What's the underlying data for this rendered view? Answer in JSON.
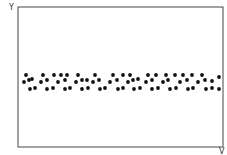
{
  "chart_data": {
    "type": "scatter",
    "title": "",
    "xlabel": "V",
    "ylabel": "Y",
    "grid": false,
    "legend": null,
    "xlim": [
      18,
      223
    ],
    "ylim": [
      147,
      7
    ],
    "note": "Dots form a horizontal band near the vertical middle of the plot, showing no relation between V and Y (pixel coordinates).",
    "points": [
      [
        26,
        75
      ],
      [
        43,
        75
      ],
      [
        54,
        75
      ],
      [
        61,
        75
      ],
      [
        67,
        75
      ],
      [
        78,
        75
      ],
      [
        95,
        75
      ],
      [
        113,
        75
      ],
      [
        123,
        75
      ],
      [
        130,
        75
      ],
      [
        148,
        75
      ],
      [
        156,
        75
      ],
      [
        166,
        75
      ],
      [
        175,
        75
      ],
      [
        183,
        75
      ],
      [
        192,
        75
      ],
      [
        202,
        75
      ],
      [
        219,
        77
      ],
      [
        24,
        82
      ],
      [
        29,
        80
      ],
      [
        32,
        79
      ],
      [
        41,
        82
      ],
      [
        47,
        80
      ],
      [
        58,
        82
      ],
      [
        65,
        80
      ],
      [
        76,
        82
      ],
      [
        82,
        80
      ],
      [
        87,
        80
      ],
      [
        93,
        82
      ],
      [
        99,
        80
      ],
      [
        110,
        82
      ],
      [
        117,
        80
      ],
      [
        128,
        82
      ],
      [
        133,
        80
      ],
      [
        138,
        79
      ],
      [
        146,
        82
      ],
      [
        152,
        80
      ],
      [
        163,
        82
      ],
      [
        168,
        80
      ],
      [
        180,
        82
      ],
      [
        187,
        80
      ],
      [
        198,
        82
      ],
      [
        205,
        80
      ],
      [
        212,
        81
      ],
      [
        30,
        89
      ],
      [
        35,
        88
      ],
      [
        47,
        89
      ],
      [
        53,
        88
      ],
      [
        65,
        89
      ],
      [
        70,
        88
      ],
      [
        82,
        89
      ],
      [
        88,
        88
      ],
      [
        100,
        89
      ],
      [
        105,
        88
      ],
      [
        118,
        89
      ],
      [
        123,
        88
      ],
      [
        134,
        89
      ],
      [
        140,
        88
      ],
      [
        152,
        89
      ],
      [
        158,
        88
      ],
      [
        170,
        89
      ],
      [
        176,
        88
      ],
      [
        188,
        89
      ],
      [
        193,
        88
      ],
      [
        206,
        89
      ],
      [
        212,
        88
      ],
      [
        219,
        89
      ]
    ]
  },
  "labels": {
    "y_axis": "Y",
    "x_axis": "V"
  }
}
